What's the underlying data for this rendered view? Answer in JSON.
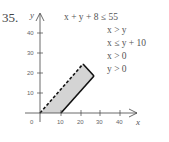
{
  "problem": {
    "number": "35.",
    "inequalities": [
      "x + y + 8 ≤ 55",
      "x > y",
      "x ≤ y + 10",
      "x > 0",
      "y > 0"
    ]
  },
  "graph": {
    "x_axis_label": "x",
    "y_axis_label": "y",
    "origin_label": "0",
    "x_ticks": [
      "10",
      "20",
      "30",
      "40"
    ],
    "y_ticks": [
      "10",
      "20",
      "30",
      "40"
    ],
    "region_fill": "#d4d4d4",
    "line_color": "#111111",
    "region_vertices": [
      [
        0,
        0
      ],
      [
        10,
        0
      ],
      [
        27.5,
        17.5
      ],
      [
        23.5,
        23.5
      ]
    ],
    "boundaries": [
      {
        "from": [
          0,
          0
        ],
        "to": [
          23.5,
          23.5
        ],
        "style": "dashed",
        "eq": "x = y"
      },
      {
        "from": [
          23.5,
          23.5
        ],
        "to": [
          27.5,
          17.5
        ],
        "style": "solid",
        "eq": "x + y = 47"
      },
      {
        "from": [
          27.5,
          17.5
        ],
        "to": [
          10,
          0
        ],
        "style": "solid",
        "eq": "x = y + 10"
      }
    ]
  }
}
